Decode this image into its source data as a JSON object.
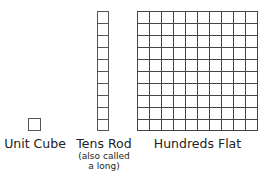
{
  "unit_cube": {
    "label": "Unit Cube",
    "cells": 1
  },
  "tens_rod": {
    "label": "Tens Rod",
    "note_line1": "(also called",
    "note_line2": "a long)",
    "cells": 10
  },
  "hundreds_flat": {
    "label": "Hundreds Flat",
    "rows": 10,
    "cols": 10
  },
  "colors": {
    "grid_line": "#555555",
    "background": "#ffffff"
  }
}
